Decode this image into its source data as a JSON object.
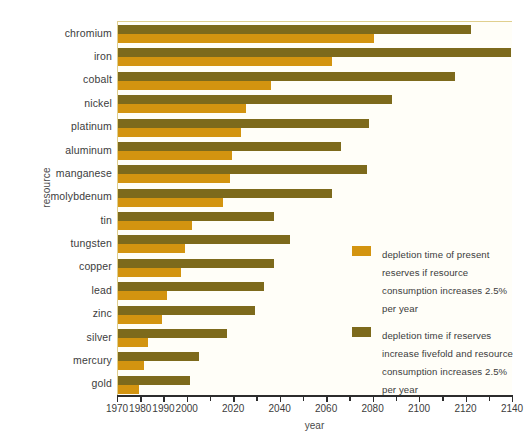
{
  "chart_data": {
    "type": "bar",
    "orientation": "horizontal",
    "title": "",
    "xlabel": "year",
    "ylabel": "resource",
    "xlim": [
      1970,
      2140
    ],
    "xticks": [
      1970,
      1980,
      1990,
      2000,
      2010,
      2020,
      2030,
      2040,
      2050,
      2060,
      2070,
      2080,
      2090,
      2100,
      2110,
      2120,
      2130,
      2140
    ],
    "xtick_labels": [
      "1970",
      "1980",
      "1990",
      "2000",
      "",
      "2020",
      "",
      "2040",
      "",
      "2060",
      "",
      "2080",
      "",
      "2100",
      "",
      "2120",
      "",
      "2140"
    ],
    "grid": false,
    "legend_position": "center-right",
    "categories": [
      "chromium",
      "iron",
      "cobalt",
      "nickel",
      "platinum",
      "aluminum",
      "manganese",
      "molybdenum",
      "tin",
      "tungsten",
      "copper",
      "lead",
      "zinc",
      "silver",
      "mercury",
      "gold"
    ],
    "series": [
      {
        "name": "depletion time of present reserves if resource consumption increases 2.5% per year",
        "color": "#d39410",
        "values": [
          2080,
          2062,
          2036,
          2025,
          2023,
          2019,
          2018,
          2015,
          2002,
          1999,
          1997,
          1991,
          1989,
          1983,
          1981,
          1979
        ]
      },
      {
        "name": "depletion time if reserves increase fivefold and resource consumption increases 2.5% per year",
        "color": "#7d6a1c",
        "values": [
          2122,
          2139,
          2115,
          2088,
          2078,
          2066,
          2077,
          2062,
          2037,
          2044,
          2037,
          2033,
          2029,
          2017,
          2005,
          2001
        ]
      }
    ]
  },
  "axis": {
    "x_title": "year",
    "y_title": "resource"
  },
  "legend": {
    "entries": [
      {
        "swatch_color": "#d39410",
        "label": "depletion time of present reserves if resource consumption increases 2.5% per year"
      },
      {
        "swatch_color": "#7d6a1c",
        "label": "depletion time if reserves increase fivefold and resource consumption increases 2.5% per year"
      }
    ]
  },
  "colors": {
    "series_present_reserves": "#d39410",
    "series_fivefold_reserves": "#7d6a1c",
    "plot_background": "#fffef8",
    "plot_border": "#e0cf8e",
    "axis_line": "#2c2c2c",
    "text": "#3c3c3c"
  }
}
